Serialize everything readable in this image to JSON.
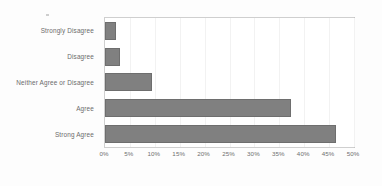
{
  "chart_data": {
    "type": "bar",
    "orientation": "horizontal",
    "title": "",
    "xlabel": "",
    "ylabel": "",
    "categories": [
      "Strongly Disagree",
      "Disagree",
      "Neither Agree or Disagree",
      "Agree",
      "Strong Agree"
    ],
    "values": [
      2.2,
      3.0,
      9.5,
      37.4,
      46.4
    ],
    "value_suffix": "%",
    "xlim": [
      0,
      50
    ],
    "xticks": [
      0,
      5,
      10,
      15,
      20,
      25,
      30,
      35,
      40,
      45,
      50
    ],
    "xtick_labels": [
      "0%",
      "5%",
      "10%",
      "15%",
      "20%",
      "25%",
      "30%",
      "35%",
      "40%",
      "45%",
      "50%"
    ],
    "grid": true,
    "grid_axis": "x",
    "legend": false,
    "bar_color": "#808080",
    "bar_edge_color": "#6e6e6e",
    "plot_border_color": "#cfcfcf",
    "gridline_color": "#f2f2f2",
    "tick_label_color": "#6f6f6f",
    "category_label_color": "#6b6b6b",
    "background_color": "#fdfdfd",
    "plot_background_color": "#ffffff"
  }
}
